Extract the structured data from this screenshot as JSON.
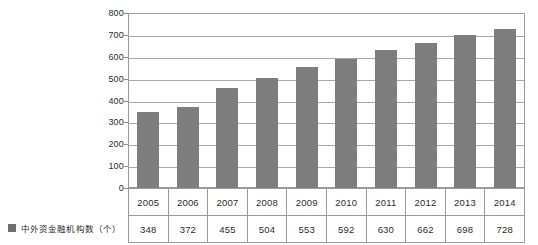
{
  "chart_data": {
    "type": "bar",
    "title": "",
    "xlabel": "",
    "ylabel": "",
    "ylim": [
      0,
      800
    ],
    "ytick_step": 100,
    "grid": true,
    "legend_position": "bottom-left",
    "categories": [
      "2005",
      "2006",
      "2007",
      "2008",
      "2009",
      "2010",
      "2011",
      "2012",
      "2013",
      "2014"
    ],
    "values": [
      348,
      372,
      455,
      504,
      553,
      592,
      630,
      662,
      698,
      728
    ],
    "series": [
      {
        "name": "中外资金融机构数（个）",
        "values": [
          348,
          372,
          455,
          504,
          553,
          592,
          630,
          662,
          698,
          728
        ],
        "color": "#7d7d7d"
      }
    ],
    "ytick_labels": [
      "800",
      "700",
      "600",
      "500",
      "400",
      "300",
      "200",
      "100",
      "0"
    ],
    "ytick_values": [
      800,
      700,
      600,
      500,
      400,
      300,
      200,
      100,
      0
    ]
  },
  "legend": {
    "label": "中外资金融机构数（个）",
    "swatch_color": "#6f6f6f"
  },
  "table": {
    "year_row": [
      "2005",
      "2006",
      "2007",
      "2008",
      "2009",
      "2010",
      "2011",
      "2012",
      "2013",
      "2014"
    ],
    "value_row": [
      "348",
      "372",
      "455",
      "504",
      "553",
      "592",
      "630",
      "662",
      "698",
      "728"
    ]
  },
  "colors": {
    "bar": "#7d7d7d",
    "gridline": "#a8a8a8",
    "border": "#9a9a9a",
    "background": "#ffffff",
    "text": "#2b2b2b"
  }
}
